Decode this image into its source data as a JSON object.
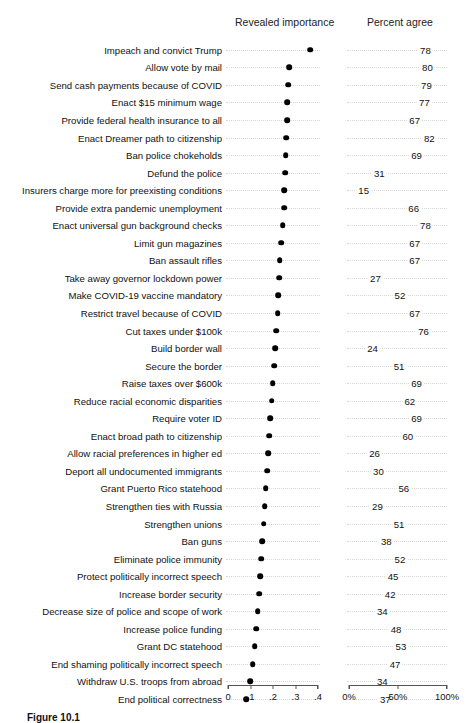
{
  "headers": {
    "importance": "Revealed importance",
    "percent": "Percent agree"
  },
  "caption": "Figure 10.1",
  "axes": {
    "importance": {
      "ticks": [
        "0",
        ".1",
        ".2",
        ".3",
        ".4"
      ],
      "values": [
        0,
        0.1,
        0.2,
        0.3,
        0.4
      ],
      "min": 0,
      "max": 0.4
    },
    "percent": {
      "ticks": [
        "0%",
        "50%",
        "100%"
      ],
      "values": [
        0,
        50,
        100
      ],
      "min": 0,
      "max": 100
    }
  },
  "chart_data": {
    "type": "scatter",
    "title": "",
    "subtitle": "",
    "xlabel": "",
    "ylabel": "",
    "grid": "dotted-row-guides",
    "legend": "none",
    "panels": [
      {
        "name": "Revealed importance",
        "xlim": [
          0,
          0.4
        ],
        "ticks": [
          0,
          0.1,
          0.2,
          0.3,
          0.4
        ],
        "tick_labels": [
          "0",
          ".1",
          ".2",
          ".3",
          ".4"
        ]
      },
      {
        "name": "Percent agree",
        "xlim": [
          0,
          100
        ],
        "ticks": [
          0,
          50,
          100
        ],
        "tick_labels": [
          "0%",
          "50%",
          "100%"
        ]
      }
    ],
    "categories": [
      "Impeach and convict Trump",
      "Allow vote by mail",
      "Send cash payments because of COVID",
      "Enact $15 minimum wage",
      "Provide federal health insurance to all",
      "Enact Dreamer path to citizenship",
      "Ban police chokeholds",
      "Defund the police",
      "Insurers charge more for preexisting conditions",
      "Provide extra pandemic unemployment",
      "Enact universal gun background checks",
      "Limit gun magazines",
      "Ban assault rifles",
      "Take away governor lockdown power",
      "Make COVID-19 vaccine mandatory",
      "Restrict travel because of COVID",
      "Cut taxes under $100k",
      "Build border wall",
      "Secure the border",
      "Raise taxes over $600k",
      "Reduce racial economic disparities",
      "Require voter ID",
      "Enact broad path to citizenship",
      "Allow racial preferences in higher ed",
      "Deport all undocumented immigrants",
      "Grant Puerto Rico statehood",
      "Strengthen ties with Russia",
      "Strengthen unions",
      "Ban guns",
      "Eliminate police immunity",
      "Protect politically incorrect speech",
      "Increase border security",
      "Decrease size of police and scope of work",
      "Increase police funding",
      "Grant DC statehood",
      "End shaming politically incorrect speech",
      "Withdraw U.S. troops from abroad",
      "End political correctness"
    ],
    "series": [
      {
        "name": "Revealed importance",
        "values": [
          0.365,
          0.272,
          0.268,
          0.264,
          0.262,
          0.258,
          0.256,
          0.253,
          0.25,
          0.249,
          0.243,
          0.237,
          0.23,
          0.227,
          0.224,
          0.221,
          0.215,
          0.211,
          0.205,
          0.199,
          0.194,
          0.188,
          0.182,
          0.178,
          0.173,
          0.167,
          0.163,
          0.158,
          0.153,
          0.148,
          0.143,
          0.138,
          0.132,
          0.126,
          0.119,
          0.11,
          0.098,
          0.081
        ]
      },
      {
        "name": "Percent agree",
        "values": [
          78,
          80,
          79,
          77,
          67,
          82,
          69,
          31,
          15,
          66,
          78,
          67,
          67,
          27,
          52,
          67,
          76,
          24,
          51,
          69,
          62,
          69,
          60,
          26,
          30,
          56,
          29,
          51,
          38,
          52,
          45,
          42,
          34,
          48,
          53,
          47,
          34,
          37
        ]
      }
    ]
  }
}
